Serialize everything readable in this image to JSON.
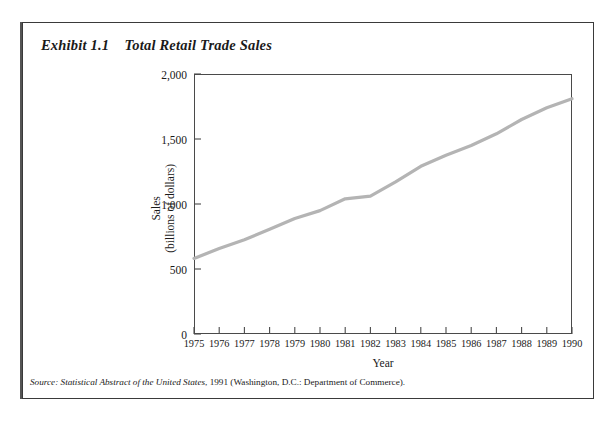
{
  "exhibit": {
    "title": "Exhibit 1.1    Total Retail Trade Sales",
    "source_prefix": "Source:",
    "source_italic": " Statistical Abstract  of the United States",
    "source_roman": ", 1991 (Washington, D.C.: Department of Commerce)."
  },
  "chart_data": {
    "type": "line",
    "title": "Total Retail Trade Sales",
    "xlabel": "Year",
    "ylabel": "Sales\n(billions of dollars)",
    "ylabel_line1": "Sales",
    "ylabel_line2": "(billions of dollars)",
    "categories": [
      "1975",
      "1976",
      "1977",
      "1978",
      "1979",
      "1980",
      "1981",
      "1982",
      "1983",
      "1984",
      "1985",
      "1986",
      "1987",
      "1988",
      "1989",
      "1990"
    ],
    "x": [
      1975,
      1976,
      1977,
      1978,
      1979,
      1980,
      1981,
      1982,
      1983,
      1984,
      1985,
      1986,
      1987,
      1988,
      1989,
      1990
    ],
    "values": [
      581,
      657,
      725,
      805,
      889,
      949,
      1040,
      1060,
      1170,
      1290,
      1375,
      1450,
      1540,
      1650,
      1740,
      1810
    ],
    "series": [
      {
        "name": "Total Retail Trade Sales",
        "color": "#b4b4b4",
        "values": [
          581,
          657,
          725,
          805,
          889,
          949,
          1040,
          1060,
          1170,
          1290,
          1375,
          1450,
          1540,
          1650,
          1740,
          1810
        ]
      }
    ],
    "ylim": [
      0,
      2000
    ],
    "yticks": [
      0,
      500,
      1000,
      1500,
      2000
    ],
    "ytick_labels": [
      "0",
      "500",
      "1,000",
      "1,500",
      "2,000"
    ],
    "xlim": [
      1975,
      1990
    ],
    "grid": false,
    "legend": "none",
    "line_color": "#b4b4b4",
    "axis_color": "#4a4a4a"
  }
}
